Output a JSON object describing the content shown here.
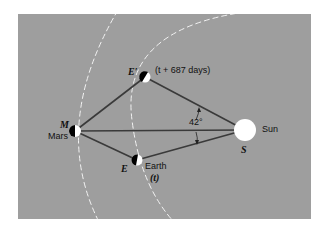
{
  "diagram": {
    "colors": {
      "background": "#9e9e9e",
      "orbit": "#f2f2f2",
      "line": "#3a3a3a",
      "sun": "#ffffff",
      "planet_dark": "#000000",
      "planet_light": "#ffffff"
    },
    "points": {
      "mars": {
        "symbol": "M",
        "name": "Mars",
        "x": 75,
        "y": 131
      },
      "earth_later": {
        "symbol": "E′",
        "caption": "(t + 687 days)",
        "x": 145,
        "y": 77
      },
      "earth": {
        "symbol": "E",
        "name": "Earth",
        "caption": "(t)",
        "x": 137,
        "y": 160
      },
      "sun": {
        "symbol": "S",
        "name": "Sun",
        "x": 245,
        "y": 130
      }
    },
    "angle_label": "42°",
    "orbits": [
      "Mars orbit (outer dashed arc)",
      "Earth orbit (inner dashed arc)"
    ]
  }
}
